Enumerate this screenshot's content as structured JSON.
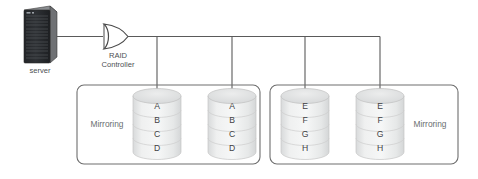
{
  "diagram": {
    "server": {
      "label": "server",
      "icon": "server-tower-icon"
    },
    "controller": {
      "label_line1": "RAID",
      "label_line2": "Controller",
      "icon": "raid-controller-gate-icon"
    },
    "groups": [
      {
        "id": "left-mirror-group",
        "label": "Mirroring",
        "label_side": "left",
        "disks": [
          {
            "id": "disk-1",
            "platters": [
              "A",
              "B",
              "C",
              "D"
            ]
          },
          {
            "id": "disk-2",
            "platters": [
              "A",
              "B",
              "C",
              "D"
            ]
          }
        ]
      },
      {
        "id": "right-mirror-group",
        "label": "Mirroring",
        "label_side": "right",
        "disks": [
          {
            "id": "disk-3",
            "platters": [
              "E",
              "F",
              "G",
              "H"
            ]
          },
          {
            "id": "disk-4",
            "platters": [
              "E",
              "F",
              "G",
              "H"
            ]
          }
        ]
      }
    ],
    "colors": {
      "wire": "#5a5a5a",
      "box_border": "#6e6e6e",
      "disk_fill": "#e9eaea",
      "disk_border": "#c6c6c6",
      "text": "#4c5053",
      "mirroring_text": "#6b6f72",
      "server_dark": "#2b2d30",
      "background": "#ffffff"
    }
  }
}
